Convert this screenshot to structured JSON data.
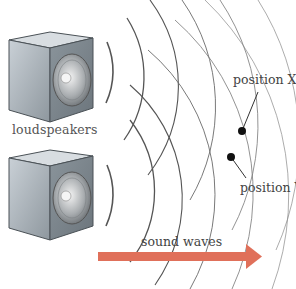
{
  "diagram": {
    "title": "",
    "labels": {
      "loudspeakers": "loudspeakers",
      "position_x": "position X",
      "position_y": "position Y",
      "sound_waves": "sound waves"
    },
    "colors": {
      "arrow": "#e0705a",
      "wave_line": "#555555",
      "dot": "#111111",
      "speaker_body": "#9aa3aa",
      "text": "#444444"
    },
    "speakers": [
      {
        "name": "upper-loudspeaker",
        "center": [
          58,
          72
        ]
      },
      {
        "name": "lower-loudspeaker",
        "center": [
          58,
          195
        ]
      }
    ],
    "points": [
      {
        "name": "position-x",
        "x": 242,
        "y": 131
      },
      {
        "name": "position-y",
        "x": 231,
        "y": 157
      }
    ],
    "arrow": {
      "from": [
        98,
        256
      ],
      "to": [
        252,
        256
      ]
    }
  }
}
